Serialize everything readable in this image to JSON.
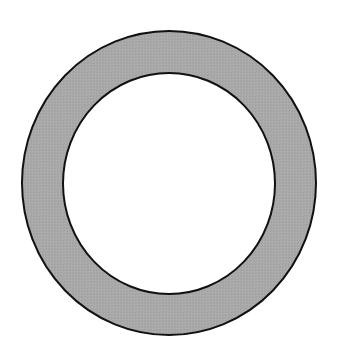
{
  "diagram": {
    "type": "annulus",
    "shape_label": "ring",
    "outer": {
      "cx": 169,
      "cy": 183,
      "rx": 147,
      "ry": 152
    },
    "inner": {
      "cx": 169,
      "cy": 183.5,
      "rx": 106,
      "ry": 110.5
    },
    "fill_color": "#a9a9a9",
    "stroke_color": "#111111",
    "stroke_width": 2,
    "background_color": "#ffffff"
  }
}
